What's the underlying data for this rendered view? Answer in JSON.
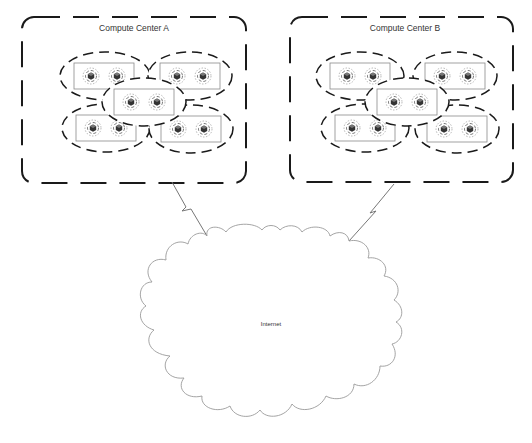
{
  "diagram": {
    "compute_centers": [
      {
        "id": "A",
        "label": "Compute Center A",
        "box": {
          "x": 22,
          "y": 17,
          "w": 224,
          "h": 166
        },
        "clusters": [
          {
            "cx": 105,
            "cy": 76,
            "rx": 45,
            "ry": 24
          },
          {
            "cx": 190,
            "cy": 76,
            "rx": 42,
            "ry": 24
          },
          {
            "cx": 144,
            "cy": 102,
            "rx": 42,
            "ry": 24
          },
          {
            "cx": 106,
            "cy": 128,
            "rx": 44,
            "ry": 24
          },
          {
            "cx": 191,
            "cy": 129,
            "rx": 42,
            "ry": 24
          }
        ]
      },
      {
        "id": "B",
        "label": "Compute Center B",
        "box": {
          "x": 290,
          "y": 17,
          "w": 223,
          "h": 165
        },
        "clusters": [
          {
            "cx": 360,
            "cy": 76,
            "rx": 44,
            "ry": 24
          },
          {
            "cx": 455,
            "cy": 76,
            "rx": 42,
            "ry": 24
          },
          {
            "cx": 407,
            "cy": 102,
            "rx": 42,
            "ry": 24
          },
          {
            "cx": 365,
            "cy": 128,
            "rx": 44,
            "ry": 24
          },
          {
            "cx": 457,
            "cy": 129,
            "rx": 42,
            "ry": 24
          }
        ]
      }
    ],
    "network": {
      "label": "Internet",
      "cloud": {
        "cx": 271,
        "cy": 323,
        "rx": 134,
        "ry": 98
      }
    },
    "links": [
      {
        "from": "Compute Center A",
        "to": "Internet",
        "type": "wireless"
      },
      {
        "from": "Compute Center B",
        "to": "Internet",
        "type": "wireless"
      }
    ],
    "node_icon": "server-cube-icon",
    "colors": {
      "stroke": "#1a1a1a",
      "cloud_stroke": "#9a9a9a",
      "server_box": "#8a8a8a"
    }
  }
}
